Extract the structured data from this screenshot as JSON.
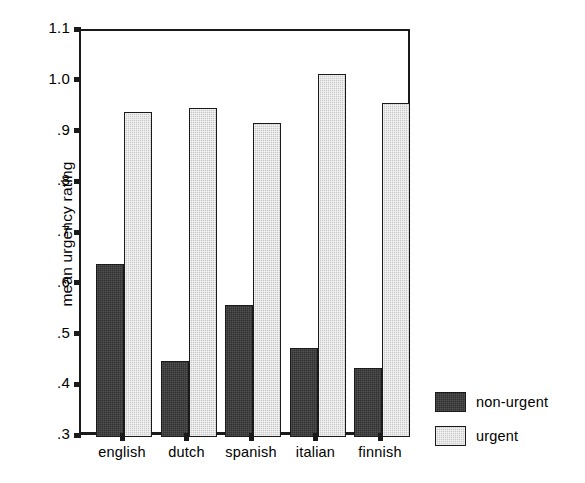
{
  "chart_data": {
    "type": "bar",
    "title": "",
    "xlabel": "",
    "ylabel": "mean urgency rating",
    "categories": [
      "english",
      "dutch",
      "spanish",
      "italian",
      "finnish"
    ],
    "series": [
      {
        "name": "non-urgent",
        "color": "#2f2f2f",
        "values": [
          0.64,
          0.45,
          0.56,
          0.475,
          0.435
        ]
      },
      {
        "name": "urgent",
        "color": "#c9c9c9",
        "values": [
          0.94,
          0.948,
          0.918,
          1.015,
          0.958
        ]
      }
    ],
    "ylim": [
      0.3,
      1.1
    ],
    "yticks": [
      "1.1",
      "1.0",
      ".9",
      ".8",
      ".7",
      ".6",
      ".5",
      ".4",
      ".3"
    ],
    "ytick_values": [
      1.1,
      1.0,
      0.9,
      0.8,
      0.7,
      0.6,
      0.5,
      0.4,
      0.3
    ],
    "grid": false,
    "legend_position": "bottom-right",
    "legend_entries": [
      {
        "label": "non-urgent",
        "swatch": "dark-hatched"
      },
      {
        "label": "urgent",
        "swatch": "light-hatched"
      }
    ]
  }
}
